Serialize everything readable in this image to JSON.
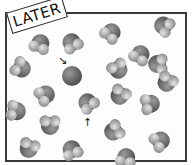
{
  "label": {
    "text": "LATER"
  },
  "colors": {
    "dark": "#4a4a4a",
    "mid": "#8a8a8a",
    "light": "#c8c8c8",
    "border": "#3a3a3a"
  },
  "arrows": [
    {
      "glyph": "↘",
      "x": 58,
      "y": 55,
      "target": "molecule near (70,75)"
    },
    {
      "glyph": "↑",
      "x": 83,
      "y": 117,
      "target": "molecule near (87,103)"
    }
  ],
  "molecules": [
    {
      "x": 40,
      "y": 44,
      "r": 9,
      "rot": 20
    },
    {
      "x": 72,
      "y": 43,
      "r": 9,
      "rot": -30
    },
    {
      "x": 111,
      "y": 33,
      "r": 9,
      "rot": 40
    },
    {
      "x": 164,
      "y": 26,
      "r": 9,
      "rot": -60
    },
    {
      "x": 21,
      "y": 68,
      "r": 9,
      "rot": 120
    },
    {
      "x": 72,
      "y": 76,
      "r": 10,
      "rot": 0,
      "plain": true
    },
    {
      "x": 140,
      "y": 55,
      "r": 9,
      "rot": 30
    },
    {
      "x": 118,
      "y": 69,
      "r": 9,
      "rot": 150
    },
    {
      "x": 158,
      "y": 64,
      "r": 9,
      "rot": -90
    },
    {
      "x": 45,
      "y": 95,
      "r": 9,
      "rot": 60
    },
    {
      "x": 120,
      "y": 95,
      "r": 9,
      "rot": 210
    },
    {
      "x": 167,
      "y": 82,
      "r": 9,
      "rot": -150
    },
    {
      "x": 16,
      "y": 111,
      "r": 9,
      "rot": 100
    },
    {
      "x": 88,
      "y": 103,
      "r": 9,
      "rot": -40
    },
    {
      "x": 150,
      "y": 104,
      "r": 9,
      "rot": 80
    },
    {
      "x": 50,
      "y": 125,
      "r": 9,
      "rot": 180
    },
    {
      "x": 114,
      "y": 131,
      "r": 9,
      "rot": -120
    },
    {
      "x": 160,
      "y": 141,
      "r": 9,
      "rot": 60
    },
    {
      "x": 29,
      "y": 148,
      "r": 9,
      "rot": 200
    },
    {
      "x": 72,
      "y": 150,
      "r": 9,
      "rot": -20
    },
    {
      "x": 126,
      "y": 158,
      "r": 9,
      "rot": 10
    }
  ]
}
